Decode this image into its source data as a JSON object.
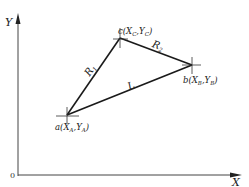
{
  "diagram": {
    "axes": {
      "x_label": "X",
      "y_label": "Y",
      "origin_label": "0",
      "color": "#333333"
    },
    "points": {
      "a": {
        "name": "a",
        "coord_text": "(X",
        "sub1": "A",
        "sep": ",Y",
        "sub2": "A",
        "close": ")",
        "px": [
          67,
          115
        ]
      },
      "b": {
        "name": "b",
        "coord_text": "(X",
        "sub1": "B",
        "sep": ",Y",
        "sub2": "B",
        "close": ")",
        "px": [
          192,
          65
        ]
      },
      "c": {
        "name": "c",
        "coord_text": "(X",
        "sub1": "C",
        "sep": ",Y",
        "sub2": "C",
        "close": ")",
        "px": [
          120,
          38
        ]
      }
    },
    "segments": [
      {
        "from": "a",
        "to": "c",
        "label": "R",
        "sub": "1"
      },
      {
        "from": "c",
        "to": "b",
        "label": "R",
        "sub": "2"
      },
      {
        "from": "a",
        "to": "b",
        "label": "L",
        "sub": ""
      }
    ],
    "line_color": "#1a1a1a"
  }
}
